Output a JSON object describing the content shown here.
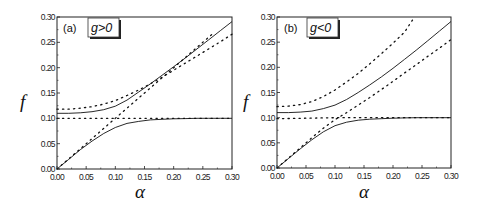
{
  "figure": {
    "panels": [
      {
        "id": "a",
        "label": "(a)",
        "legend": "g>0",
        "xlabel": "α",
        "ylabel": "f"
      },
      {
        "id": "b",
        "label": "(b)",
        "legend": "g<0",
        "xlabel": "α",
        "ylabel": "f"
      }
    ],
    "x_ticks": [
      "0.00",
      "0.05",
      "0.10",
      "0.15",
      "0.20",
      "0.25",
      "0.30"
    ],
    "y_ticks": [
      "0.00",
      "0.05",
      "0.10",
      "0.15",
      "0.20",
      "0.25",
      "0.30"
    ]
  },
  "chart_data": [
    {
      "type": "line",
      "title": "(a) g>0",
      "xlabel": "α",
      "ylabel": "f",
      "xlim": [
        0,
        0.3
      ],
      "ylim": [
        0,
        0.3
      ],
      "grid": false,
      "legend": "g>0",
      "series": [
        {
          "name": "upper branch (solid)",
          "style": "solid",
          "x": [
            0,
            0.02,
            0.04,
            0.06,
            0.08,
            0.1,
            0.12,
            0.14,
            0.16,
            0.18,
            0.2,
            0.22,
            0.24,
            0.26,
            0.28,
            0.3
          ],
          "y": [
            0.11,
            0.11,
            0.111,
            0.113,
            0.117,
            0.124,
            0.136,
            0.152,
            0.168,
            0.185,
            0.202,
            0.219,
            0.237,
            0.255,
            0.273,
            0.291
          ]
        },
        {
          "name": "lower branch (solid)",
          "style": "solid",
          "x": [
            0,
            0.02,
            0.04,
            0.06,
            0.08,
            0.1,
            0.12,
            0.14,
            0.16,
            0.18,
            0.2,
            0.22,
            0.24,
            0.26,
            0.28,
            0.3
          ],
          "y": [
            0.0,
            0.019,
            0.038,
            0.055,
            0.07,
            0.082,
            0.09,
            0.094,
            0.097,
            0.098,
            0.099,
            0.0995,
            0.1,
            0.1,
            0.1,
            0.1
          ]
        },
        {
          "name": "dotted upper",
          "style": "dotted",
          "x": [
            0,
            0.02,
            0.04,
            0.06,
            0.08,
            0.1,
            0.12,
            0.14,
            0.16,
            0.18,
            0.2,
            0.22,
            0.24,
            0.26,
            0.28,
            0.3
          ],
          "y": [
            0.118,
            0.118,
            0.12,
            0.123,
            0.128,
            0.135,
            0.145,
            0.156,
            0.168,
            0.181,
            0.195,
            0.209,
            0.223,
            0.237,
            0.251,
            0.266
          ]
        },
        {
          "name": "dotted diagonal f=α",
          "style": "dotted",
          "x": [
            0,
            0.05,
            0.1,
            0.15,
            0.2,
            0.25,
            0.265
          ],
          "y": [
            0,
            0.05,
            0.1,
            0.15,
            0.2,
            0.25,
            0.265
          ]
        },
        {
          "name": "dotted flat f=0.10",
          "style": "dotted",
          "x": [
            0,
            0.05,
            0.1,
            0.15,
            0.2,
            0.25,
            0.3
          ],
          "y": [
            0.1,
            0.1,
            0.1,
            0.1,
            0.1,
            0.1,
            0.1
          ]
        }
      ]
    },
    {
      "type": "line",
      "title": "(b) g<0",
      "xlabel": "α",
      "ylabel": "f",
      "xlim": [
        0,
        0.3
      ],
      "ylim": [
        0,
        0.3
      ],
      "grid": false,
      "legend": "g<0",
      "series": [
        {
          "name": "upper branch (solid)",
          "style": "solid",
          "x": [
            0,
            0.02,
            0.04,
            0.06,
            0.08,
            0.1,
            0.12,
            0.14,
            0.16,
            0.18,
            0.2,
            0.22,
            0.24,
            0.26,
            0.28,
            0.3
          ],
          "y": [
            0.11,
            0.11,
            0.111,
            0.113,
            0.118,
            0.125,
            0.136,
            0.15,
            0.165,
            0.181,
            0.198,
            0.216,
            0.234,
            0.253,
            0.272,
            0.291
          ]
        },
        {
          "name": "lower branch (solid)",
          "style": "solid",
          "x": [
            0,
            0.02,
            0.04,
            0.06,
            0.08,
            0.1,
            0.12,
            0.14,
            0.16,
            0.18,
            0.2,
            0.22,
            0.24,
            0.26,
            0.28,
            0.3
          ],
          "y": [
            0.0,
            0.019,
            0.038,
            0.056,
            0.072,
            0.084,
            0.091,
            0.095,
            0.097,
            0.098,
            0.099,
            0.0995,
            0.1,
            0.1,
            0.1,
            0.1
          ]
        },
        {
          "name": "dotted upper",
          "style": "dotted",
          "x": [
            0,
            0.02,
            0.04,
            0.06,
            0.08,
            0.1,
            0.12,
            0.14,
            0.16,
            0.18,
            0.2,
            0.22,
            0.237
          ],
          "y": [
            0.122,
            0.123,
            0.126,
            0.132,
            0.142,
            0.155,
            0.171,
            0.188,
            0.207,
            0.227,
            0.248,
            0.27,
            0.3
          ]
        },
        {
          "name": "dotted lower diagonal",
          "style": "dotted",
          "x": [
            0,
            0.04,
            0.06,
            0.08,
            0.1,
            0.12,
            0.14,
            0.16,
            0.18,
            0.2,
            0.22,
            0.24,
            0.26,
            0.28,
            0.3
          ],
          "y": [
            0,
            0.04,
            0.06,
            0.079,
            0.096,
            0.11,
            0.125,
            0.14,
            0.156,
            0.172,
            0.189,
            0.205,
            0.222,
            0.238,
            0.255
          ]
        },
        {
          "name": "dotted flat f=0.10",
          "style": "dotted",
          "x": [
            0,
            0.05,
            0.1,
            0.15,
            0.2,
            0.25,
            0.3
          ],
          "y": [
            0.098,
            0.099,
            0.1,
            0.1,
            0.1,
            0.1,
            0.1
          ]
        }
      ]
    }
  ]
}
